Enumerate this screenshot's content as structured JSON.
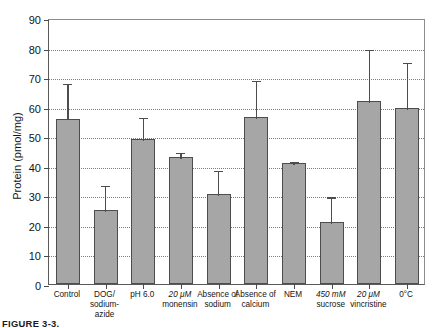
{
  "figure": {
    "caption": "FIGURE 3-3. Uptake of protein by cells.",
    "caption_label": "FIGURE 3-3."
  },
  "chart_data": {
    "type": "bar",
    "title": "",
    "xlabel": "",
    "ylabel": "Protein (pmol/mg)",
    "ylim": [
      0,
      90
    ],
    "ytick_values": [
      0,
      10,
      20,
      30,
      40,
      50,
      60,
      70,
      80,
      90
    ],
    "ytick_labels": [
      "0",
      "10",
      "20",
      "30",
      "40",
      "50",
      "60",
      "70",
      "80",
      "90"
    ],
    "grid": true,
    "grid_axis": "y",
    "legend": "none",
    "bar_color": "#a6a6a6",
    "bar_edge_color": "#4d4d4d",
    "error_bar_color": "#4d4d4d",
    "categories": [
      "Control",
      "DOG/ sodium-azide",
      "pH 6.0",
      "20 μM monensin",
      "Absence of sodium",
      "Absence of calcium",
      "NEM",
      "450 mM sucrose",
      "20 μM vincristine",
      "0°C"
    ],
    "category_lines": [
      [
        "Control"
      ],
      [
        "DOG/ sodium-",
        "azide"
      ],
      [
        "pH 6.0"
      ],
      [
        "20 μM",
        "monensin"
      ],
      [
        "Absence of",
        "sodium"
      ],
      [
        "Absence of",
        "calcium"
      ],
      [
        "NEM"
      ],
      [
        "450 mM",
        "sucrose"
      ],
      [
        "20 μM",
        "vincristine"
      ],
      [
        "0°C"
      ]
    ],
    "values": [
      56,
      25,
      49,
      43,
      30.5,
      56.5,
      41,
      21,
      62,
      59.5
    ],
    "errors_upper": [
      68.5,
      34,
      57,
      45,
      39,
      69.5,
      42,
      30,
      80,
      75.5
    ],
    "series": [
      {
        "name": "Protein uptake",
        "values": [
          56,
          25,
          49,
          43,
          30.5,
          56.5,
          41,
          21,
          62,
          59.5
        ],
        "error_high": [
          12.5,
          9,
          8,
          2,
          8.5,
          13,
          1,
          9,
          18,
          16
        ]
      }
    ]
  }
}
